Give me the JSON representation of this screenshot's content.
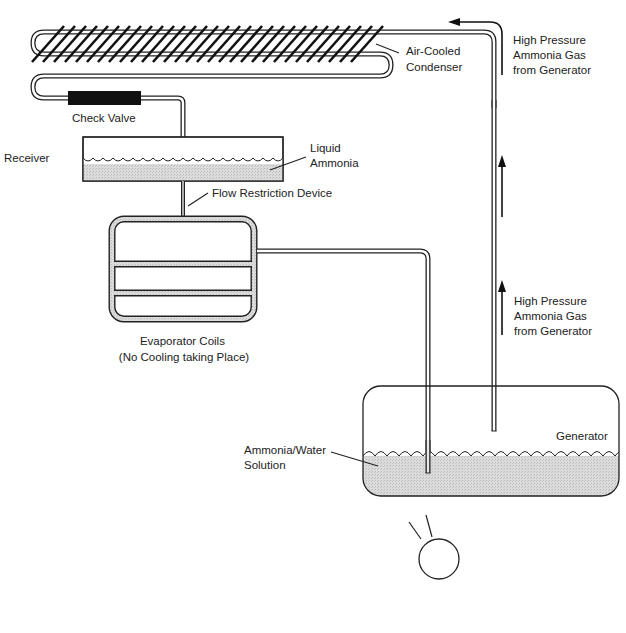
{
  "diagram": {
    "labels": {
      "condenser": [
        "Air-Cooled",
        "Condenser"
      ],
      "gas_top": [
        "High Pressure",
        "Ammonia Gas",
        "from Generator"
      ],
      "gas_mid": [
        "High Pressure",
        "Ammonia Gas",
        "from Generator"
      ],
      "check_valve": "Check Valve",
      "receiver": "Receiver",
      "liquid_ammonia": [
        "Liquid",
        "Ammonia"
      ],
      "flow_restriction": "Flow Restriction Device",
      "evaporator": [
        "Evaporator Coils",
        "(No Cooling taking Place)"
      ],
      "generator": "Generator",
      "solution": [
        "Ammonia/Water",
        "Solution"
      ],
      "heat_source": [
        "Heat Source",
        "Operating"
      ]
    },
    "colors": {
      "line": "#222222",
      "liquid_fill": "#d4d4d4",
      "check_valve": "#111111",
      "background": "#ffffff"
    },
    "components": [
      {
        "name": "Air-Cooled Condenser",
        "type": "finned-coil"
      },
      {
        "name": "Check Valve",
        "type": "valve"
      },
      {
        "name": "Receiver",
        "type": "tank",
        "contains": "Liquid Ammonia"
      },
      {
        "name": "Flow Restriction Device",
        "type": "restrictor"
      },
      {
        "name": "Evaporator Coils",
        "type": "coil",
        "state": "No Cooling taking Place"
      },
      {
        "name": "Generator",
        "type": "tank",
        "contains": "Ammonia/Water Solution"
      },
      {
        "name": "Heat Source",
        "type": "burner",
        "state": "Operating"
      }
    ],
    "flows": [
      {
        "from": "Generator",
        "to": "Air-Cooled Condenser",
        "medium": "High Pressure Ammonia Gas"
      },
      {
        "from": "Air-Cooled Condenser",
        "to": "Check Valve"
      },
      {
        "from": "Check Valve",
        "to": "Receiver"
      },
      {
        "from": "Receiver",
        "to": "Flow Restriction Device"
      },
      {
        "from": "Flow Restriction Device",
        "to": "Evaporator Coils"
      },
      {
        "from": "Evaporator Coils",
        "to": "Generator"
      }
    ]
  }
}
